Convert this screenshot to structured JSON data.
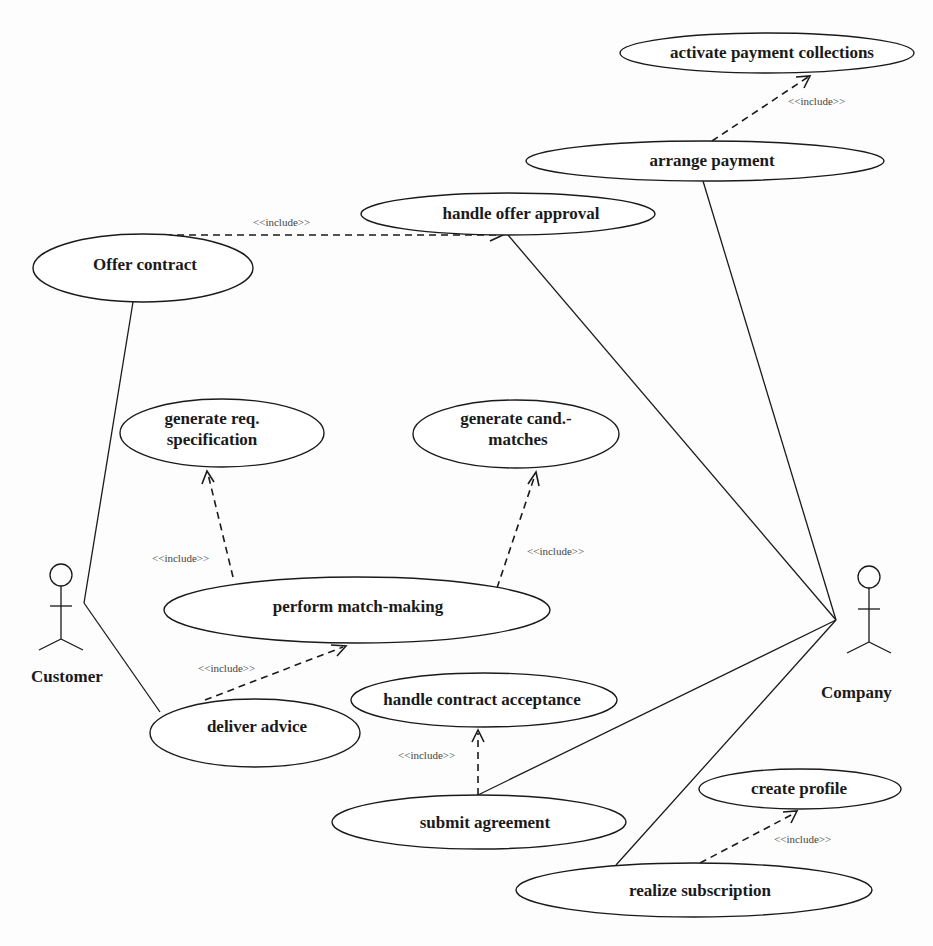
{
  "diagram": {
    "type": "UML use case diagram",
    "actors": [
      {
        "id": "customer",
        "label": "Customer"
      },
      {
        "id": "company",
        "label": "Company"
      }
    ],
    "use_cases": [
      {
        "id": "activate_payment",
        "label": "activate payment collections"
      },
      {
        "id": "arrange_payment",
        "label": "arrange payment"
      },
      {
        "id": "handle_offer_approval",
        "label": "handle offer approval"
      },
      {
        "id": "offer_contract",
        "label": "Offer contract"
      },
      {
        "id": "gen_req_spec",
        "label_line1": "generate req.",
        "label_line2": "specification"
      },
      {
        "id": "gen_cand_matches",
        "label_line1": "generate cand.-",
        "label_line2": "matches"
      },
      {
        "id": "perform_matchmaking",
        "label": "perform match-making"
      },
      {
        "id": "handle_contract_acceptance",
        "label": "handle contract acceptance"
      },
      {
        "id": "deliver_advice",
        "label": "deliver advice"
      },
      {
        "id": "submit_agreement",
        "label": "submit agreement"
      },
      {
        "id": "create_profile",
        "label": "create profile"
      },
      {
        "id": "realize_subscription",
        "label": "realize subscription"
      }
    ],
    "include_label": "<<include>>",
    "includes": [
      {
        "from": "arrange_payment",
        "to": "activate_payment",
        "label": "<<include>>"
      },
      {
        "from": "offer_contract",
        "to": "handle_offer_approval",
        "label": "<<include>>"
      },
      {
        "from": "perform_matchmaking",
        "to": "gen_req_spec",
        "label": "<<include>>"
      },
      {
        "from": "perform_matchmaking",
        "to": "gen_cand_matches",
        "label": "<<include>>"
      },
      {
        "from": "deliver_advice",
        "to": "perform_matchmaking",
        "label": "<<include>>"
      },
      {
        "from": "submit_agreement",
        "to": "handle_contract_acceptance",
        "label": "<<include>>"
      },
      {
        "from": "realize_subscription",
        "to": "create_profile",
        "label": "<<include>>"
      }
    ],
    "associations": [
      {
        "actor": "customer",
        "use_case": "offer_contract"
      },
      {
        "actor": "customer",
        "use_case": "deliver_advice"
      },
      {
        "actor": "company",
        "use_case": "arrange_payment"
      },
      {
        "actor": "company",
        "use_case": "handle_offer_approval"
      },
      {
        "actor": "company",
        "use_case": "submit_agreement"
      },
      {
        "actor": "company",
        "use_case": "realize_subscription"
      }
    ]
  }
}
